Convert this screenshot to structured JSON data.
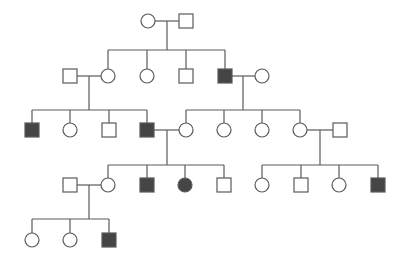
{
  "colors": {
    "line": "#5a5a5a",
    "affected_fill": "#454545",
    "unaffected_fill": "#ffffff",
    "background": "#ffffff"
  },
  "symbol_size": 14,
  "individuals": [
    {
      "id": "I-1",
      "generation": 1,
      "sex": "female",
      "affected": false,
      "x": 148,
      "y": 21
    },
    {
      "id": "I-2",
      "generation": 1,
      "sex": "male",
      "affected": false,
      "x": 186,
      "y": 21
    },
    {
      "id": "II-1",
      "generation": 2,
      "sex": "male",
      "affected": false,
      "x": 70,
      "y": 76
    },
    {
      "id": "II-2",
      "generation": 2,
      "sex": "female",
      "affected": false,
      "x": 108,
      "y": 76
    },
    {
      "id": "II-3",
      "generation": 2,
      "sex": "female",
      "affected": false,
      "x": 147,
      "y": 76
    },
    {
      "id": "II-4",
      "generation": 2,
      "sex": "male",
      "affected": false,
      "x": 186,
      "y": 76
    },
    {
      "id": "II-5",
      "generation": 2,
      "sex": "male",
      "affected": true,
      "x": 225,
      "y": 76
    },
    {
      "id": "II-6",
      "generation": 2,
      "sex": "female",
      "affected": false,
      "x": 262,
      "y": 76
    },
    {
      "id": "III-1",
      "generation": 3,
      "sex": "male",
      "affected": true,
      "x": 32,
      "y": 130
    },
    {
      "id": "III-2",
      "generation": 3,
      "sex": "female",
      "affected": false,
      "x": 70,
      "y": 130
    },
    {
      "id": "III-3",
      "generation": 3,
      "sex": "male",
      "affected": false,
      "x": 109,
      "y": 130
    },
    {
      "id": "III-4",
      "generation": 3,
      "sex": "male",
      "affected": true,
      "x": 147,
      "y": 130
    },
    {
      "id": "III-5",
      "generation": 3,
      "sex": "female",
      "affected": false,
      "x": 186,
      "y": 130
    },
    {
      "id": "III-6",
      "generation": 3,
      "sex": "female",
      "affected": false,
      "x": 224,
      "y": 130
    },
    {
      "id": "III-7",
      "generation": 3,
      "sex": "female",
      "affected": false,
      "x": 262,
      "y": 130
    },
    {
      "id": "III-8",
      "generation": 3,
      "sex": "female",
      "affected": false,
      "x": 300,
      "y": 130
    },
    {
      "id": "III-9",
      "generation": 3,
      "sex": "male",
      "affected": false,
      "x": 340,
      "y": 130
    },
    {
      "id": "IV-1",
      "generation": 4,
      "sex": "male",
      "affected": false,
      "x": 70,
      "y": 185
    },
    {
      "id": "IV-2",
      "generation": 4,
      "sex": "female",
      "affected": false,
      "x": 108,
      "y": 185
    },
    {
      "id": "IV-3",
      "generation": 4,
      "sex": "male",
      "affected": true,
      "x": 147,
      "y": 185
    },
    {
      "id": "IV-4",
      "generation": 4,
      "sex": "female",
      "affected": true,
      "x": 185,
      "y": 185
    },
    {
      "id": "IV-5",
      "generation": 4,
      "sex": "male",
      "affected": false,
      "x": 224,
      "y": 185
    },
    {
      "id": "IV-6",
      "generation": 4,
      "sex": "female",
      "affected": false,
      "x": 262,
      "y": 185
    },
    {
      "id": "IV-7",
      "generation": 4,
      "sex": "male",
      "affected": false,
      "x": 301,
      "y": 185
    },
    {
      "id": "IV-8",
      "generation": 4,
      "sex": "female",
      "affected": false,
      "x": 339,
      "y": 185
    },
    {
      "id": "IV-9",
      "generation": 4,
      "sex": "male",
      "affected": true,
      "x": 378,
      "y": 185
    },
    {
      "id": "V-1",
      "generation": 5,
      "sex": "female",
      "affected": false,
      "x": 32,
      "y": 240
    },
    {
      "id": "V-2",
      "generation": 5,
      "sex": "female",
      "affected": false,
      "x": 70,
      "y": 240
    },
    {
      "id": "V-3",
      "generation": 5,
      "sex": "male",
      "affected": true,
      "x": 109,
      "y": 240
    }
  ],
  "families": [
    {
      "parents": [
        "I-1",
        "I-2"
      ],
      "junction_x": 167,
      "sibship_y": 50,
      "children": [
        "II-2",
        "II-3",
        "II-4",
        "II-5"
      ]
    },
    {
      "parents": [
        "II-1",
        "II-2"
      ],
      "junction_x": 89,
      "sibship_y": 110,
      "children": [
        "III-1",
        "III-2",
        "III-3",
        "III-4"
      ]
    },
    {
      "parents": [
        "II-5",
        "II-6"
      ],
      "junction_x": 243,
      "sibship_y": 110,
      "children": [
        "III-5",
        "III-6",
        "III-7",
        "III-8"
      ]
    },
    {
      "parents": [
        "III-4",
        "III-5"
      ],
      "junction_x": 167,
      "sibship_y": 165,
      "children": [
        "IV-2",
        "IV-3",
        "IV-4",
        "IV-5"
      ]
    },
    {
      "parents": [
        "III-8",
        "III-9"
      ],
      "junction_x": 320,
      "sibship_y": 165,
      "children": [
        "IV-6",
        "IV-7",
        "IV-8",
        "IV-9"
      ]
    },
    {
      "parents": [
        "IV-1",
        "IV-2"
      ],
      "junction_x": 89,
      "sibship_y": 219,
      "children": [
        "V-1",
        "V-2",
        "V-3"
      ]
    }
  ]
}
